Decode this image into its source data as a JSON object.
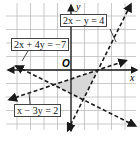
{
  "axes": {
    "x_label": "x",
    "y_label": "y",
    "origin_label": "O"
  },
  "lines": [
    {
      "id": "l1",
      "equation": "2x − y = 4",
      "a": 2,
      "b": -1,
      "c": 4
    },
    {
      "id": "l2",
      "equation": "2x + 4y = −7",
      "a": 2,
      "b": 4,
      "c": -7
    },
    {
      "id": "l3",
      "equation": "x − 3y = 2",
      "a": 1,
      "b": -3,
      "c": 2
    }
  ],
  "shaded_region": "triangle bounded by the three lines",
  "colors": {
    "grid": "#b5b5b5",
    "line": "#1a1a1a",
    "shade": "#d8d8d8"
  }
}
